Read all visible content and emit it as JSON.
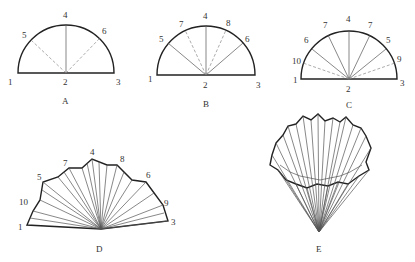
{
  "figures": [
    {
      "id": "A",
      "caption": "A",
      "labels": [
        "1",
        "2",
        "3",
        "4",
        "5",
        "6"
      ]
    },
    {
      "id": "B",
      "caption": "B",
      "labels": [
        "1",
        "2",
        "3",
        "4",
        "5",
        "6",
        "7",
        "8"
      ]
    },
    {
      "id": "C",
      "caption": "C",
      "labels": [
        "1",
        "2",
        "3",
        "4",
        "7",
        "7",
        "6",
        "5",
        "10",
        "9"
      ]
    },
    {
      "id": "D",
      "caption": "D",
      "labels": [
        "1",
        "3",
        "4",
        "5",
        "6",
        "7",
        "8",
        "9",
        "10"
      ]
    },
    {
      "id": "E",
      "caption": "E"
    }
  ]
}
